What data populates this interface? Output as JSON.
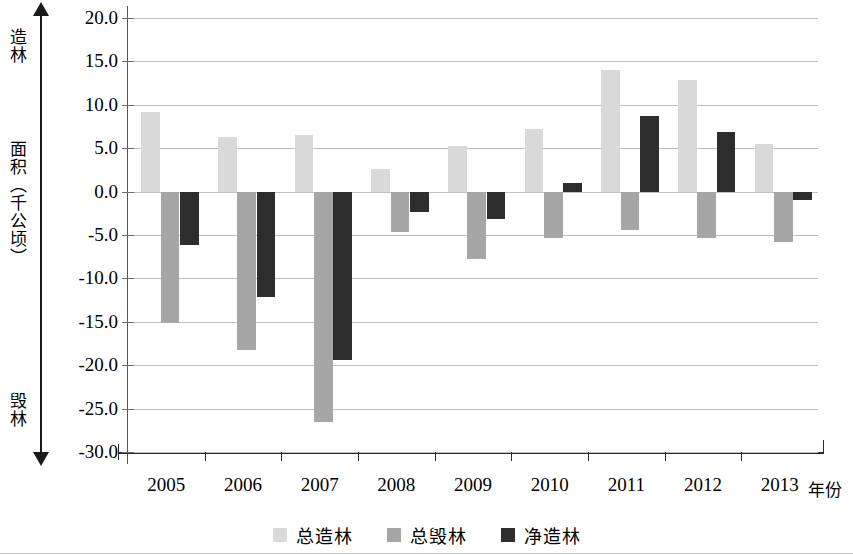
{
  "axis": {
    "vertical_top_label": "造林",
    "vertical_mid_label": "面积（千公顷）",
    "vertical_bottom_label": "毁林",
    "x_unit_label": "年份",
    "y_ticks": [
      "20.0",
      "15.0",
      "10.0",
      "5.0",
      "0.0",
      "-5.0",
      "-10.0",
      "-15.0",
      "-20.0",
      "-25.0",
      "-30.0"
    ]
  },
  "legend": {
    "items": [
      {
        "label": "总造林",
        "color": "#d9d9d9"
      },
      {
        "label": "总毁林",
        "color": "#a6a6a6"
      },
      {
        "label": "净造林",
        "color": "#2e2e2e"
      }
    ]
  },
  "chart_data": {
    "type": "bar",
    "title": "",
    "subtitle": "",
    "xlabel": "年份",
    "ylabel": "面积（千公顷）",
    "ylim": [
      -30.0,
      20.0
    ],
    "ytick_step": 5.0,
    "grid": true,
    "legend_position": "bottom",
    "categories": [
      "2005",
      "2006",
      "2007",
      "2008",
      "2009",
      "2010",
      "2011",
      "2012",
      "2013"
    ],
    "series": [
      {
        "name": "总造林",
        "color": "#d9d9d9",
        "values": [
          9.2,
          6.3,
          6.5,
          2.6,
          5.3,
          7.2,
          14.0,
          12.9,
          5.5
        ]
      },
      {
        "name": "总毁林",
        "color": "#a6a6a6",
        "values": [
          -15.1,
          -18.2,
          -26.5,
          -4.6,
          -7.8,
          -5.3,
          -4.4,
          -5.4,
          -5.8
        ]
      },
      {
        "name": "净造林",
        "color": "#2e2e2e",
        "values": [
          -6.1,
          -12.1,
          -19.4,
          -2.3,
          -3.2,
          1.0,
          8.7,
          6.9,
          -1.0
        ]
      }
    ],
    "annotations": {
      "top_direction": "造林",
      "bottom_direction": "毁林"
    }
  }
}
